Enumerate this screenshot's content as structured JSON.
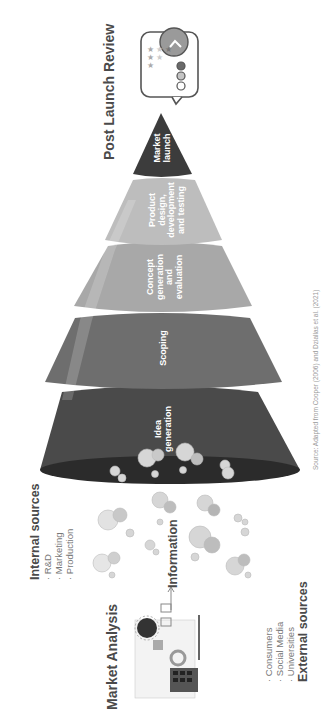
{
  "orientation": "rotated 90 degrees counter-clockwise",
  "title_top": "Post Launch Review",
  "title_bottom": "Market Analysis",
  "funnel": {
    "stages": [
      {
        "label": "Market\nlaunch",
        "color": "#3c3c3c"
      },
      {
        "label": "Product\ndesign,\ndevelopment\nand testing",
        "color": "#bdbdbd"
      },
      {
        "label": "Concept\ngeneration\nand\nevaluation",
        "color": "#a8a8a8"
      },
      {
        "label": "Scoping",
        "color": "#6e6e6e"
      },
      {
        "label": "Idea\ngeneration",
        "color": "#4a4a4a"
      }
    ]
  },
  "information_label": "Information",
  "internal_sources": {
    "title": "Internal sources",
    "items": [
      "R&D",
      "Marketing",
      "Production"
    ]
  },
  "external_sources": {
    "title": "External sources",
    "items": [
      "Consumers",
      "Social Media",
      "Universities"
    ]
  },
  "review_icon": {
    "stars_rows": [
      1,
      2,
      3
    ],
    "dots": [
      "#ffffff",
      "#c4c4c4",
      "#6a6a6a"
    ],
    "arrow": "chevron-right"
  },
  "citation": "Source: Adapted from Cooper (2006) and Dziallas et al. (2021)"
}
